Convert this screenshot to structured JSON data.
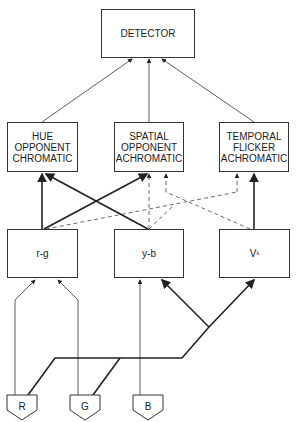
{
  "diagram": {
    "detector": "DETECTOR",
    "channels": [
      {
        "label": "HUE OPPONENT CHROMATIC",
        "lines": [
          "HUE",
          "OPPONENT",
          "CHROMATIC"
        ]
      },
      {
        "label": "SPATIAL OPPONENT ACHROMATIC",
        "lines": [
          "SPATIAL",
          "OPPONENT",
          "ACHROMATIC"
        ]
      },
      {
        "label": "TEMPORAL FLICKER ACHROMATIC",
        "lines": [
          "TEMPORAL",
          "FLICKER",
          "ACHROMATIC"
        ]
      }
    ],
    "mechanisms": [
      "r-g",
      "y-b",
      "V",
      "λ"
    ],
    "receptors": [
      "R",
      "G",
      "B"
    ]
  }
}
